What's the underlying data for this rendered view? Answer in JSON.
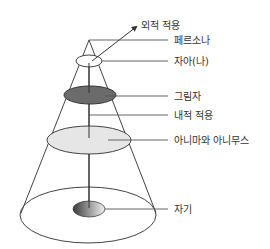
{
  "diagram": {
    "type": "psyche-structure-cone",
    "labels": {
      "external_adaptation": "외적 적용",
      "persona": "페르소나",
      "ego": "자아(나)",
      "shadow": "그림자",
      "internal_adaptation": "내적 적용",
      "anima_animus": "아니마와 아니무스",
      "self": "자기"
    },
    "colors": {
      "line": "#444444",
      "shadow_fill": "#6b6b6b",
      "anima_fill": "#e6e6e6",
      "ego_fill": "#ffffff",
      "self_gradient_dark": "#3a3a3a",
      "self_gradient_light": "#f2f2f2"
    }
  }
}
